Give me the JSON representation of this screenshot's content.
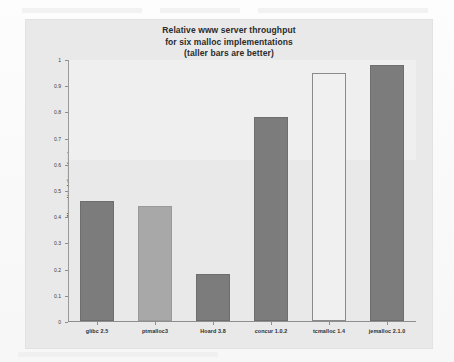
{
  "chart_data": {
    "type": "bar",
    "title": "Relative www server throughput for six malloc implementations (taller bars are better)",
    "title_lines": [
      "Relative www server throughput",
      "for six malloc implementations",
      "(taller bars are better)"
    ],
    "categories": [
      "glibc 2.5",
      "ptmalloc3",
      "Hoard 3.8",
      "concur 1.0.2",
      "tcmalloc 1.4",
      "jemalloc 2.1.0"
    ],
    "values": [
      0.46,
      0.44,
      0.18,
      0.78,
      0.95,
      0.98
    ],
    "bar_styles": [
      "filled-dark",
      "filled-light",
      "filled-dark",
      "filled-dark",
      "hollow",
      "filled-dark"
    ],
    "xlabel": "",
    "ylabel": "Normalized throughput",
    "ylim": [
      0,
      1
    ],
    "ytick_values": [
      0,
      0.1,
      0.2,
      0.3,
      0.4,
      0.5,
      0.6,
      0.7,
      0.8,
      0.9,
      1
    ],
    "ytick_labels": [
      "0",
      "0.1",
      "0.2",
      "0.3",
      "0.4",
      "0.5",
      "0.6",
      "0.7",
      "0.8",
      "0.9",
      "1"
    ],
    "grid": false,
    "legend": null,
    "colors": {
      "bar_dark": "#7c7c7c",
      "bar_light": "#a8a8a8",
      "bar_hollow": "#f0f0f0",
      "panel_background": "#e9e9e9",
      "axis": "#8e8e8e",
      "text": "#2e2e2e"
    }
  }
}
